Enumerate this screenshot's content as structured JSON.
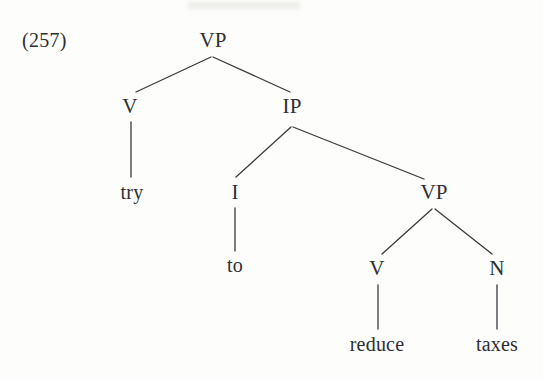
{
  "figure": {
    "example_number": "(257)",
    "kind": "syntax-tree",
    "ink_color": "#2e2e33",
    "line_color": "#3a3a3f",
    "background_color": "#fdfdfb"
  },
  "tree": {
    "nodes": [
      {
        "id": "vp-root",
        "label": "VP",
        "type": "category",
        "x": 213,
        "y": 30
      },
      {
        "id": "v-upper",
        "label": "V",
        "type": "category",
        "x": 130,
        "y": 96
      },
      {
        "id": "ip",
        "label": "IP",
        "type": "category",
        "x": 292,
        "y": 96
      },
      {
        "id": "try",
        "label": "try",
        "type": "terminal",
        "x": 132,
        "y": 182
      },
      {
        "id": "i",
        "label": "I",
        "type": "category",
        "x": 235,
        "y": 182
      },
      {
        "id": "vp-lower",
        "label": "VP",
        "type": "category",
        "x": 434,
        "y": 182
      },
      {
        "id": "to",
        "label": "to",
        "type": "terminal",
        "x": 235,
        "y": 255
      },
      {
        "id": "v-lower",
        "label": "V",
        "type": "category",
        "x": 377,
        "y": 258
      },
      {
        "id": "n",
        "label": "N",
        "type": "category",
        "x": 497,
        "y": 258
      },
      {
        "id": "reduce",
        "label": "reduce",
        "type": "terminal",
        "x": 377,
        "y": 334
      },
      {
        "id": "taxes",
        "label": "taxes",
        "type": "terminal",
        "x": 497,
        "y": 334
      }
    ],
    "edges": [
      {
        "from": "vp-root",
        "to": "v-upper",
        "x1": 211,
        "y1": 57,
        "x2": 136,
        "y2": 92
      },
      {
        "from": "vp-root",
        "to": "ip",
        "x1": 213,
        "y1": 57,
        "x2": 290,
        "y2": 92
      },
      {
        "from": "v-upper",
        "to": "try",
        "x1": 131,
        "y1": 122,
        "x2": 131,
        "y2": 177
      },
      {
        "from": "ip",
        "to": "i",
        "x1": 291,
        "y1": 127,
        "x2": 236,
        "y2": 177
      },
      {
        "from": "ip",
        "to": "vp-lower",
        "x1": 293,
        "y1": 127,
        "x2": 424,
        "y2": 179
      },
      {
        "from": "i",
        "to": "to",
        "x1": 235,
        "y1": 208,
        "x2": 235,
        "y2": 251
      },
      {
        "from": "vp-lower",
        "to": "v-lower",
        "x1": 432,
        "y1": 209,
        "x2": 382,
        "y2": 254
      },
      {
        "from": "vp-lower",
        "to": "n",
        "x1": 435,
        "y1": 209,
        "x2": 492,
        "y2": 254
      },
      {
        "from": "v-lower",
        "to": "reduce",
        "x1": 378,
        "y1": 285,
        "x2": 378,
        "y2": 329
      },
      {
        "from": "n",
        "to": "taxes",
        "x1": 497,
        "y1": 285,
        "x2": 497,
        "y2": 329
      }
    ],
    "sentence": "try to reduce taxes"
  }
}
